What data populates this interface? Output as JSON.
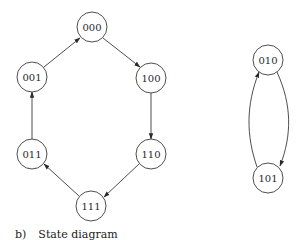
{
  "caption": {
    "label": "b)",
    "title": "State diagram"
  },
  "nodes": {
    "n000": {
      "label": "000",
      "cx": 92,
      "cy": 27
    },
    "n001": {
      "label": "001",
      "cx": 32,
      "cy": 77
    },
    "n100": {
      "label": "100",
      "cx": 151,
      "cy": 78
    },
    "n011": {
      "label": "011",
      "cx": 32,
      "cy": 154
    },
    "n110": {
      "label": "110",
      "cx": 151,
      "cy": 154
    },
    "n111": {
      "label": "111",
      "cx": 91,
      "cy": 206
    },
    "n010": {
      "label": "010",
      "cx": 268,
      "cy": 60
    },
    "n101": {
      "label": "101",
      "cx": 268,
      "cy": 178
    }
  },
  "edges": [
    {
      "from": "000",
      "to": "100"
    },
    {
      "from": "100",
      "to": "110"
    },
    {
      "from": "110",
      "to": "111"
    },
    {
      "from": "111",
      "to": "011"
    },
    {
      "from": "011",
      "to": "001"
    },
    {
      "from": "001",
      "to": "000"
    },
    {
      "from": "010",
      "to": "101"
    },
    {
      "from": "101",
      "to": "010"
    }
  ]
}
